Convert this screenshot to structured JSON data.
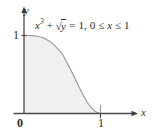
{
  "figure": {
    "kind": "cartesian-graph",
    "background_color": "#ffffff",
    "annotation": {
      "full_text": "x³ + √y = 1, 0 ≤ x ≤ 1",
      "base": "x",
      "exponent": "3",
      "plus": " + ",
      "radical_sign": "√",
      "radicand": "y",
      "equals": " = 1, 0 ",
      "le_first": "≤",
      "variable": " x ",
      "le_second": "≤",
      "upper_bound": " 1"
    },
    "axes": {
      "x_label": "x",
      "y_label": "y",
      "x_ticks": [
        "1"
      ],
      "y_ticks": [
        "1"
      ],
      "origin_label": "0",
      "axis_color": "#4a4a4a",
      "x_range": [
        -0.13,
        1.4
      ],
      "y_range": [
        -0.08,
        1.32
      ]
    },
    "curve": {
      "equation": "y = (1 - x^3)^2",
      "domain": [
        0,
        1
      ],
      "stroke_color": "#9b9b9b",
      "fill_color": "#f0f0f0",
      "points": [
        [
          0.0,
          1.0
        ],
        [
          0.05,
          0.99975
        ],
        [
          0.1,
          0.998
        ],
        [
          0.15,
          0.99326
        ],
        [
          0.2,
          0.98406
        ],
        [
          0.25,
          0.96924
        ],
        [
          0.3,
          0.94674
        ],
        [
          0.35,
          0.91532
        ],
        [
          0.4,
          0.87309
        ],
        [
          0.45,
          0.81926
        ],
        [
          0.5,
          0.7656
        ],
        [
          0.55,
          0.67158
        ],
        [
          0.6,
          0.58142
        ],
        [
          0.65,
          0.48253
        ],
        [
          0.7,
          0.38067
        ],
        [
          0.75,
          0.28076
        ],
        [
          0.8,
          0.18901
        ],
        [
          0.85,
          0.1118
        ],
        [
          0.9,
          0.05336
        ],
        [
          0.95,
          0.01604
        ],
        [
          1.0,
          0.0
        ]
      ]
    }
  }
}
